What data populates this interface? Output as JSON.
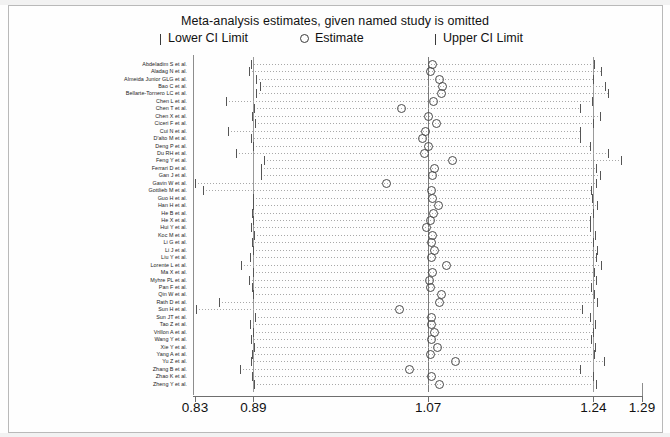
{
  "title": "Meta-analysis estimates, given named study is omitted",
  "legend": {
    "lower": "Lower CI Limit",
    "estimate": "Estimate",
    "upper": "Upper CI Limit",
    "lower_glyph": "pipe-icon",
    "estimate_glyph": "open-circle-icon",
    "upper_glyph": "pipe-icon"
  },
  "axis": {
    "ticks": [
      {
        "label": "0.83",
        "value": 0.83
      },
      {
        "label": "0.89",
        "value": 0.89
      },
      {
        "label": "1.07",
        "value": 1.07
      },
      {
        "label": "1.24",
        "value": 1.24
      },
      {
        "label": "1.29",
        "value": 1.29
      }
    ],
    "xmin": 0.83,
    "xmax": 1.29
  },
  "reference_lines": [
    0.89,
    1.07,
    1.24
  ],
  "chart_data": {
    "type": "scatter",
    "title": "Meta-analysis estimates, given named study is omitted",
    "xlabel": "",
    "ylabel": "",
    "xlim": [
      0.83,
      1.29
    ],
    "grid": true,
    "legend_position": "top",
    "series": [
      {
        "name": "Lower CI Limit",
        "marker": "pipe"
      },
      {
        "name": "Estimate",
        "marker": "open-circle"
      },
      {
        "name": "Upper CI Limit",
        "marker": "pipe"
      }
    ],
    "categories": [
      "Abdeladim S et al.",
      "Aladag N et al.",
      "Almeida Junior GLG et al.",
      "Bao C et al.",
      "Bellarte-Tornero LC et al.",
      "Chen L et al.",
      "Chen T et al.",
      "Chen X et al.",
      "Ciceri F et al.",
      "Cui N et al.",
      "D'alto M et al.",
      "Deng P et al.",
      "Du RH et al.",
      "Feng Y et al.",
      "Ferrari D et al.",
      "Gan J et al.",
      "Gavin W et al.",
      "Gottlieb M et al.",
      "Guo H et al.",
      "Han H et al.",
      "He B et al.",
      "He X et al.",
      "Hui Y et al.",
      "Koc M et al.",
      "Li G et al.",
      "Li J et al.",
      "Liu Y et al.",
      "Lorente L et al.",
      "Ma X et al.",
      "Myhre PL et al.",
      "Pan F et al.",
      "Qin W et al.",
      "Rath D et al.",
      "Sun H et al.",
      "Sun JT et al.",
      "Tao Z et al.",
      "Vrillon A et al.",
      "Wang Y et al.",
      "Xie Y et al.",
      "Yang A et al.",
      "Yu Z et al.",
      "Zhang B et al.",
      "Zhao K et al.",
      "Zheng Y et al."
    ],
    "points": [
      {
        "study": "Abdeladim S et al.",
        "lower": 0.888,
        "estimate": 1.074,
        "upper": 1.241
      },
      {
        "study": "Aladag N et al.",
        "lower": 0.886,
        "estimate": 1.072,
        "upper": 1.248
      },
      {
        "study": "Almeida Junior GLG et al.",
        "lower": 0.893,
        "estimate": 1.081,
        "upper": 1.24
      },
      {
        "study": "Bao C et al.",
        "lower": 0.897,
        "estimate": 1.084,
        "upper": 1.252
      },
      {
        "study": "Bellarte-Tornero LC et al.",
        "lower": 0.893,
        "estimate": 1.083,
        "upper": 1.255
      },
      {
        "study": "Chen L et al.",
        "lower": 0.862,
        "estimate": 1.075,
        "upper": 1.239
      },
      {
        "study": "Chen T et al.",
        "lower": 0.891,
        "estimate": 1.042,
        "upper": 1.226
      },
      {
        "study": "Chen X et al.",
        "lower": 0.889,
        "estimate": 1.07,
        "upper": 1.247
      },
      {
        "study": "Ciceri F et al.",
        "lower": 0.892,
        "estimate": 1.078,
        "upper": 1.24
      },
      {
        "study": "Cui N et al.",
        "lower": 0.864,
        "estimate": 1.067,
        "upper": 1.226
      },
      {
        "study": "D'alto M et al.",
        "lower": 0.888,
        "estimate": 1.064,
        "upper": 1.226
      },
      {
        "study": "Deng P et al.",
        "lower": 0.89,
        "estimate": 1.07,
        "upper": 1.236
      },
      {
        "study": "Du RH et al.",
        "lower": 0.872,
        "estimate": 1.066,
        "upper": 1.255
      },
      {
        "study": "Feng Y et al.",
        "lower": 0.901,
        "estimate": 1.094,
        "upper": 1.268
      },
      {
        "study": "Ferrari D et al.",
        "lower": 0.898,
        "estimate": 1.076,
        "upper": 1.243
      },
      {
        "study": "Gan J et al.",
        "lower": 0.898,
        "estimate": 1.074,
        "upper": 1.247
      },
      {
        "study": "Gavin W et al.",
        "lower": 0.83,
        "estimate": 1.027,
        "upper": 1.243
      },
      {
        "study": "Gottlieb M et al.",
        "lower": 0.838,
        "estimate": 1.073,
        "upper": 1.238
      },
      {
        "study": "Guo H et al.",
        "lower": 0.89,
        "estimate": 1.074,
        "upper": 1.239
      },
      {
        "study": "Han H et al.",
        "lower": 0.89,
        "estimate": 1.08,
        "upper": 1.244
      },
      {
        "study": "He B et al.",
        "lower": 0.889,
        "estimate": 1.075,
        "upper": 1.24
      },
      {
        "study": "He X et al.",
        "lower": 0.89,
        "estimate": 1.072,
        "upper": 1.236
      },
      {
        "study": "Hui Y et al.",
        "lower": 0.888,
        "estimate": 1.068,
        "upper": 1.236
      },
      {
        "study": "Koc M et al.",
        "lower": 0.891,
        "estimate": 1.074,
        "upper": 1.242
      },
      {
        "study": "Li G et al.",
        "lower": 0.889,
        "estimate": 1.073,
        "upper": 1.24
      },
      {
        "study": "Li J et al.",
        "lower": 0.89,
        "estimate": 1.076,
        "upper": 1.244
      },
      {
        "study": "Liu Y et al.",
        "lower": 0.887,
        "estimate": 1.073,
        "upper": 1.243
      },
      {
        "study": "Lorente L et al.",
        "lower": 0.877,
        "estimate": 1.088,
        "upper": 1.248
      },
      {
        "study": "Ma X et al.",
        "lower": 0.89,
        "estimate": 1.074,
        "upper": 1.241
      },
      {
        "study": "Myhre PL et al.",
        "lower": 0.886,
        "estimate": 1.071,
        "upper": 1.243
      },
      {
        "study": "Pan F et al.",
        "lower": 0.889,
        "estimate": 1.072,
        "upper": 1.237
      },
      {
        "study": "Qin W et al.",
        "lower": 0.89,
        "estimate": 1.083,
        "upper": 1.241
      },
      {
        "study": "Rath D et al.",
        "lower": 0.855,
        "estimate": 1.081,
        "upper": 1.244
      },
      {
        "study": "Sun H et al.",
        "lower": 0.831,
        "estimate": 1.04,
        "upper": 1.228
      },
      {
        "study": "Sun JT et al.",
        "lower": 0.892,
        "estimate": 1.073,
        "upper": 1.236
      },
      {
        "study": "Tao Z et al.",
        "lower": 0.887,
        "estimate": 1.073,
        "upper": 1.242
      },
      {
        "study": "Vrillon A et al.",
        "lower": 0.89,
        "estimate": 1.076,
        "upper": 1.24
      },
      {
        "study": "Wang Y et al.",
        "lower": 0.888,
        "estimate": 1.073,
        "upper": 1.237
      },
      {
        "study": "Xie Y et al.",
        "lower": 0.891,
        "estimate": 1.079,
        "upper": 1.242
      },
      {
        "study": "Yang A et al.",
        "lower": 0.889,
        "estimate": 1.072,
        "upper": 1.241
      },
      {
        "study": "Yu Z et al.",
        "lower": 0.888,
        "estimate": 1.098,
        "upper": 1.251
      },
      {
        "study": "Zhang B et al.",
        "lower": 0.876,
        "estimate": 1.05,
        "upper": 1.226
      },
      {
        "study": "Zhao K et al.",
        "lower": 0.889,
        "estimate": 1.073,
        "upper": 1.24
      },
      {
        "study": "Zheng Y et al.",
        "lower": 0.891,
        "estimate": 1.081,
        "upper": 1.243
      }
    ]
  }
}
